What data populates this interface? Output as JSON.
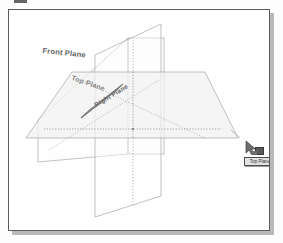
{
  "figure": {
    "kind": "cad-reference-planes-isometric",
    "background_color": "#ffffff",
    "frame_border_color": "#5c5c5c",
    "shadow_color": "#b9b9b9"
  },
  "planes": [
    {
      "id": "front-plane",
      "label": "Front Plane",
      "orientation": "vertical-front",
      "fill_color": "#fcfcfc",
      "edge_color": "#9a9a9a",
      "label_rotation_deg": 6
    },
    {
      "id": "top-plane",
      "label": "Top Plane",
      "orientation": "horizontal",
      "fill_color": "#f4f4f4",
      "edge_color": "#a5a5a5",
      "label_rotation_deg": 19
    },
    {
      "id": "right-plane",
      "label": "Right Plane",
      "orientation": "vertical-right",
      "fill_color": "#fbfbfb",
      "edge_color": "#9d9d9d",
      "label_rotation_deg": -31
    }
  ],
  "intersection_lines": {
    "style": "dotted",
    "color": "#8c8c8c",
    "description": "Dotted lines where the three reference planes intersect"
  },
  "cursor": {
    "type": "drag-cursor",
    "icon": "arrow-with-drag-badge",
    "tooltip_text": "Top Plane",
    "tooltip_background": "#e2e2e2",
    "tooltip_border": "#4d4d4d"
  },
  "artifacts": {
    "top_scan_mark": true
  }
}
